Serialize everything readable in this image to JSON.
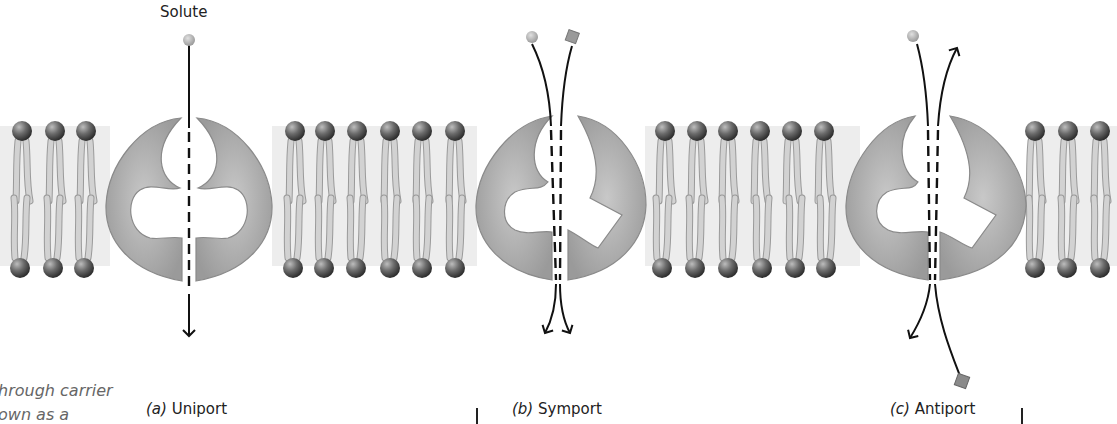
{
  "diagram": {
    "title_label": "Solute",
    "panels": [
      {
        "letter": "(a)",
        "name": "Uniport"
      },
      {
        "letter": "(b)",
        "name": "Symport"
      },
      {
        "letter": "(c)",
        "name": "Antiport"
      }
    ],
    "side_text": [
      "hrough carrier",
      "own as a"
    ],
    "colors": {
      "protein": "#a9a9a9",
      "lipid_head": "#6b6b6b",
      "lipid_tail": "#c4c4c4",
      "membrane_band": "#ececec",
      "arrow": "#111111"
    }
  }
}
